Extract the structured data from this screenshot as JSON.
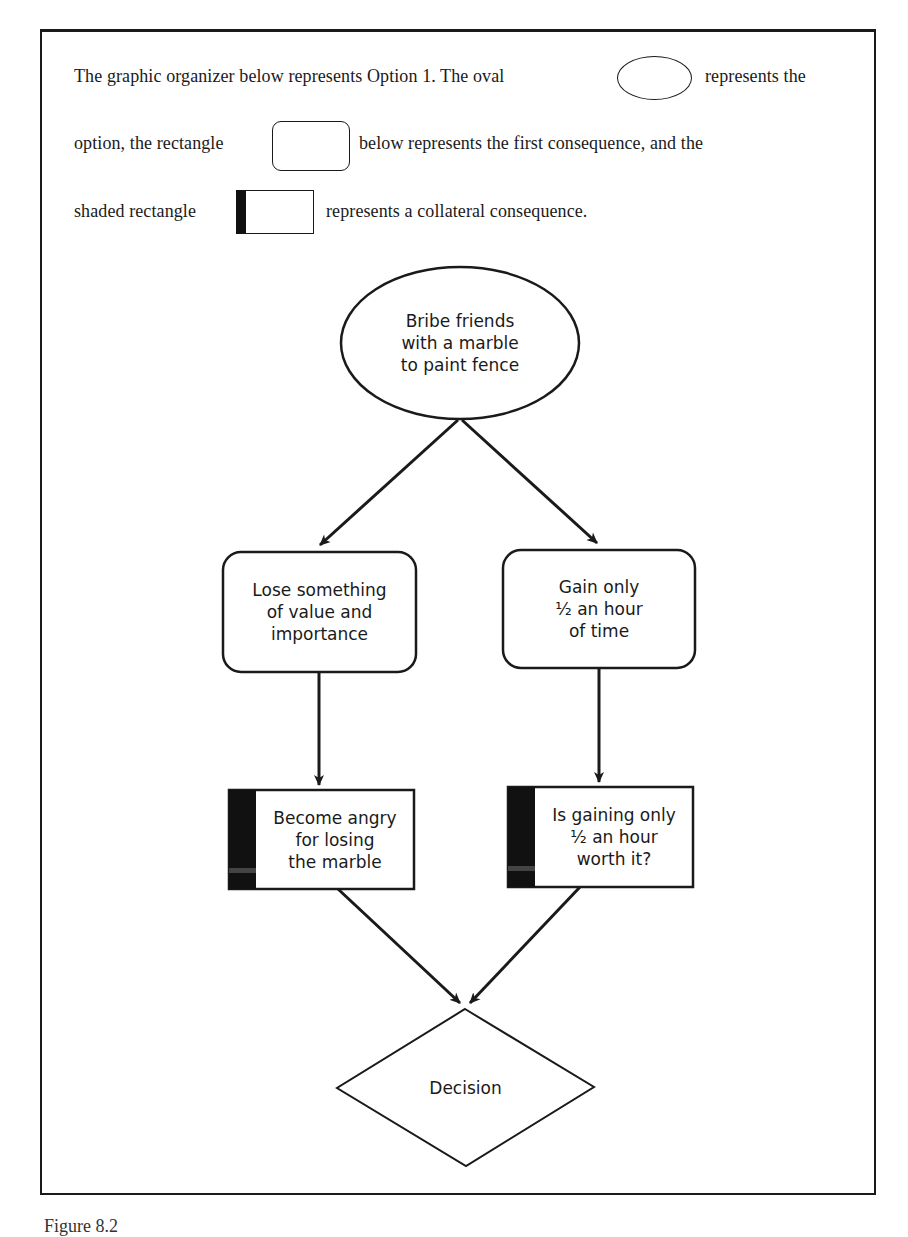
{
  "intro": {
    "line1_before": "The graphic organizer below represents Option 1. The oval",
    "line1_after": "represents the",
    "line2_before": "option, the rectangle",
    "line2_after": "below represents the first consequence, and the",
    "line3_before": "shaded rectangle",
    "line3_after": "represents a collateral consequence."
  },
  "diagram": {
    "option": "Bribe friends\nwith a marble\nto paint fence",
    "consequence_left": "Lose something\nof value and\nimportance",
    "consequence_right": "Gain only\n½ an hour\nof time",
    "collateral_left": "Become angry\nfor losing\nthe marble",
    "collateral_right": "Is gaining only\n½ an hour\nworth it?",
    "decision": "Decision"
  },
  "caption": "Figure 8.2",
  "colors": {
    "stroke": "#1a1a1a",
    "shade": "#111111",
    "background": "#ffffff"
  }
}
